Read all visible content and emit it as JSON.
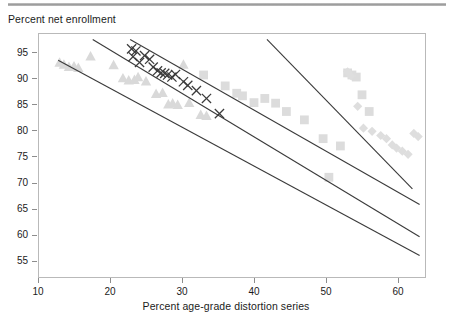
{
  "figure": {
    "top_rule_color": "#9a9a9a",
    "background": "#ffffff",
    "y_axis_title": "Percent net enrollment",
    "x_axis_title": "Percent age-grade distortion series"
  },
  "chart_data": {
    "type": "scatter",
    "title": "",
    "xlabel": "Percent age-grade distortion series",
    "ylabel": "Percent net enrollment",
    "xlim": [
      10,
      64.5
    ],
    "ylim": [
      52,
      97.5
    ],
    "grid": false,
    "legend": "none",
    "xticks": [
      10,
      20,
      30,
      40,
      50,
      60
    ],
    "yticks": [
      55,
      60,
      65,
      70,
      75,
      80,
      85,
      90,
      95
    ],
    "xtick_labels": [
      "10",
      "20",
      "30",
      "40",
      "50",
      "60"
    ],
    "ytick_labels": [
      "55",
      "60",
      "65",
      "70",
      "75",
      "80",
      "85",
      "90",
      "95"
    ],
    "series": [
      {
        "name": "triangles",
        "marker": "triangle",
        "color": "#d9d9d9",
        "points": [
          [
            13.0,
            93.0
          ],
          [
            13.6,
            92.6
          ],
          [
            14.3,
            92.2
          ],
          [
            15.0,
            92.3
          ],
          [
            15.6,
            92.0
          ],
          [
            17.3,
            94.2
          ],
          [
            20.5,
            92.5
          ],
          [
            21.8,
            90.0
          ],
          [
            22.6,
            89.6
          ],
          [
            23.4,
            89.7
          ],
          [
            23.9,
            90.2
          ],
          [
            25.0,
            89.4
          ],
          [
            26.4,
            87.0
          ],
          [
            27.3,
            87.2
          ],
          [
            28.1,
            85.0
          ],
          [
            28.7,
            85.2
          ],
          [
            29.4,
            84.9
          ],
          [
            30.2,
            92.6
          ],
          [
            31.0,
            85.3
          ],
          [
            32.6,
            83.0
          ],
          [
            33.4,
            82.8
          ]
        ]
      },
      {
        "name": "squares",
        "marker": "square",
        "color": "#dcdcdc",
        "points": [
          [
            33.0,
            90.6
          ],
          [
            36.0,
            88.5
          ],
          [
            37.6,
            87.1
          ],
          [
            38.4,
            86.6
          ],
          [
            40.0,
            85.3
          ],
          [
            41.5,
            86.1
          ],
          [
            43.0,
            85.2
          ],
          [
            44.5,
            83.6
          ],
          [
            47.0,
            82.0
          ],
          [
            49.6,
            78.4
          ],
          [
            50.4,
            71.0
          ],
          [
            52.0,
            77.0
          ],
          [
            53.0,
            91.0
          ],
          [
            53.6,
            90.6
          ],
          [
            54.2,
            90.2
          ],
          [
            55.0,
            86.8
          ],
          [
            56.0,
            83.6
          ]
        ]
      },
      {
        "name": "diamonds",
        "marker": "diamond",
        "color": "#dedede",
        "points": [
          [
            53.0,
            91.2
          ],
          [
            53.5,
            90.4
          ],
          [
            54.4,
            84.6
          ],
          [
            55.2,
            80.4
          ],
          [
            56.4,
            79.8
          ],
          [
            57.6,
            79.0
          ],
          [
            58.4,
            78.4
          ],
          [
            59.2,
            77.2
          ],
          [
            59.8,
            76.6
          ],
          [
            60.6,
            76.0
          ],
          [
            61.4,
            75.4
          ],
          [
            62.2,
            79.4
          ],
          [
            62.8,
            78.8
          ]
        ]
      },
      {
        "name": "crosses",
        "marker": "x",
        "color": "#3a3a3a",
        "points": [
          [
            23.2,
            94.1
          ],
          [
            23.0,
            95.6
          ],
          [
            23.6,
            95.2
          ],
          [
            24.1,
            93.0
          ],
          [
            24.8,
            94.3
          ],
          [
            25.5,
            93.6
          ],
          [
            26.0,
            92.1
          ],
          [
            26.6,
            91.4
          ],
          [
            27.1,
            91.0
          ],
          [
            27.6,
            90.9
          ],
          [
            28.0,
            90.6
          ],
          [
            28.6,
            90.2
          ],
          [
            29.1,
            90.7
          ],
          [
            30.2,
            89.3
          ],
          [
            30.8,
            88.6
          ],
          [
            32.0,
            87.6
          ],
          [
            33.4,
            86.1
          ],
          [
            35.2,
            83.2
          ]
        ]
      }
    ],
    "fit_lines": [
      {
        "name": "fit-line-1",
        "x0": 12.8,
        "y0": 93.4,
        "x1": 63.0,
        "y1": 56.0
      },
      {
        "name": "fit-line-2",
        "x0": 17.6,
        "y0": 97.4,
        "x1": 63.0,
        "y1": 59.6
      },
      {
        "name": "fit-line-3",
        "x0": 22.8,
        "y0": 97.4,
        "x1": 63.0,
        "y1": 65.8
      },
      {
        "name": "fit-line-4",
        "x0": 41.8,
        "y0": 97.4,
        "x1": 62.0,
        "y1": 68.8
      }
    ]
  }
}
